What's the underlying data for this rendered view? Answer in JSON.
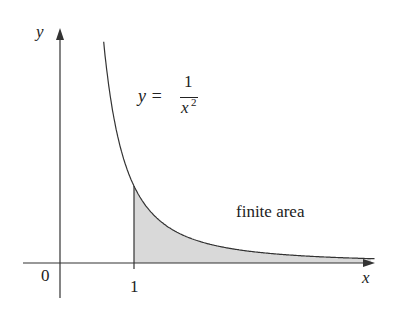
{
  "labels": {
    "y_axis": "y",
    "x_axis": "x",
    "origin": "0",
    "tick_one": "1",
    "eq_lhs": "y =",
    "eq_num": "1",
    "eq_den": "x",
    "eq_exp": "2",
    "area": "finite area"
  },
  "colors": {
    "stroke": "#333333",
    "fill": "#d9d9d9"
  },
  "chart_data": {
    "type": "area",
    "title": "",
    "function": "y = 1/x^2",
    "shaded_region": {
      "from_x": 1,
      "to_x": "infinity",
      "label": "finite area"
    },
    "x_ticks": [
      "0",
      "1"
    ],
    "xlabel": "x",
    "ylabel": "y"
  }
}
